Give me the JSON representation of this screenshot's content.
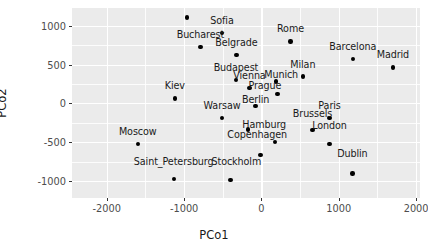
{
  "chart_data": {
    "type": "scatter",
    "title": "",
    "xlabel": "PCo1",
    "ylabel": "PCo2",
    "xlim": [
      -2450,
      2050
    ],
    "ylim": [
      -1220,
      1230
    ],
    "xticks": [
      -2000,
      -1000,
      0,
      1000,
      2000
    ],
    "xticklabels": [
      "-2000",
      "-1000",
      "0",
      "1000",
      "2000"
    ],
    "yticks": [
      1000,
      500,
      0,
      -500,
      -1000
    ],
    "yticklabels": [
      "1000",
      "500",
      "0",
      "-500",
      "-1000"
    ],
    "xminor": [
      -1500,
      -500,
      500,
      1500
    ],
    "yminor": [
      750,
      250,
      -250,
      -750
    ],
    "grid": true,
    "legend": "none",
    "panel_background": "#ebebeb",
    "grid_color": "#ffffff",
    "point_color": "#000000",
    "points": [
      {
        "label": "Istanbul",
        "x": -960,
        "y": 1110,
        "lx": -960,
        "ly": 1110,
        "dx": 0,
        "dy": -7
      },
      {
        "label": "Sofia",
        "x": -510,
        "y": 910,
        "lx": -510,
        "ly": 910,
        "dx": 0,
        "dy": -7
      },
      {
        "label": "Bucharest",
        "x": -790,
        "y": 725,
        "lx": -790,
        "ly": 725,
        "dx": 0,
        "dy": -7
      },
      {
        "label": "Belgrade",
        "x": -325,
        "y": 625,
        "lx": -325,
        "ly": 625,
        "dx": 0,
        "dy": -7
      },
      {
        "label": "Rome",
        "x": 375,
        "y": 800,
        "lx": 375,
        "ly": 800,
        "dx": 0,
        "dy": -7
      },
      {
        "label": "Barcelona",
        "x": 1180,
        "y": 570,
        "lx": 1180,
        "ly": 570,
        "dx": 0,
        "dy": -7
      },
      {
        "label": "Madrid",
        "x": 1700,
        "y": 465,
        "lx": 1700,
        "ly": 465,
        "dx": 0,
        "dy": -7
      },
      {
        "label": "Budapest",
        "x": -330,
        "y": 305,
        "lx": -330,
        "ly": 305,
        "dx": 0,
        "dy": -7
      },
      {
        "label": "Milan",
        "x": 535,
        "y": 345,
        "lx": 535,
        "ly": 345,
        "dx": 0,
        "dy": -7
      },
      {
        "label": "Vienna",
        "x": -155,
        "y": 200,
        "lx": -155,
        "ly": 200,
        "dx": 0,
        "dy": -7
      },
      {
        "label": "Munich",
        "x": 190,
        "y": 280,
        "lx": 255,
        "ly": 215,
        "dx": 0,
        "dy": -7
      },
      {
        "label": "Kiev",
        "x": -1120,
        "y": 65,
        "lx": -1120,
        "ly": 65,
        "dx": 0,
        "dy": -7
      },
      {
        "label": "Prague",
        "x": 205,
        "y": 120,
        "lx": 45,
        "ly": 75,
        "dx": 0,
        "dy": -7
      },
      {
        "label": "Warsaw",
        "x": -510,
        "y": -190,
        "lx": -510,
        "ly": -190,
        "dx": 0,
        "dy": -7
      },
      {
        "label": "Paris",
        "x": 880,
        "y": -185,
        "lx": 880,
        "ly": -185,
        "dx": 0,
        "dy": -7
      },
      {
        "label": "Berlin",
        "x": -75,
        "y": -35,
        "lx": -75,
        "ly": -115,
        "dx": 0,
        "dy": -7
      },
      {
        "label": "Brussels",
        "x": 660,
        "y": -345,
        "lx": 660,
        "ly": -295,
        "dx": 0,
        "dy": -7
      },
      {
        "label": "Moscow",
        "x": -1600,
        "y": -520,
        "lx": -1600,
        "ly": -520,
        "dx": 0,
        "dy": -7
      },
      {
        "label": "Hamburg",
        "x": -175,
        "y": -335,
        "lx": 35,
        "ly": -430,
        "dx": 0,
        "dy": -7
      },
      {
        "label": "London",
        "x": 880,
        "y": -520,
        "lx": 880,
        "ly": -450,
        "dx": 0,
        "dy": -7
      },
      {
        "label": "Copenhagen",
        "x": 175,
        "y": -500,
        "lx": -55,
        "ly": -560,
        "dx": 0,
        "dy": -7
      },
      {
        "label": "Dublin",
        "x": 1175,
        "y": -905,
        "lx": 1175,
        "ly": -810,
        "dx": 0,
        "dy": -7
      },
      {
        "label": "Saint_Petersburg",
        "x": -1135,
        "y": -975,
        "lx": -1135,
        "ly": -905,
        "dx": 0,
        "dy": -7
      },
      {
        "label": "Stockholm",
        "x": -400,
        "y": -985,
        "lx": -325,
        "ly": -905,
        "dx": 0,
        "dy": -7
      },
      {
        "label": "Hamburg_pt",
        "x": -15,
        "y": -665,
        "lx": -15,
        "ly": -665,
        "dx": 0,
        "dy": -7,
        "hide_label": true
      }
    ]
  }
}
